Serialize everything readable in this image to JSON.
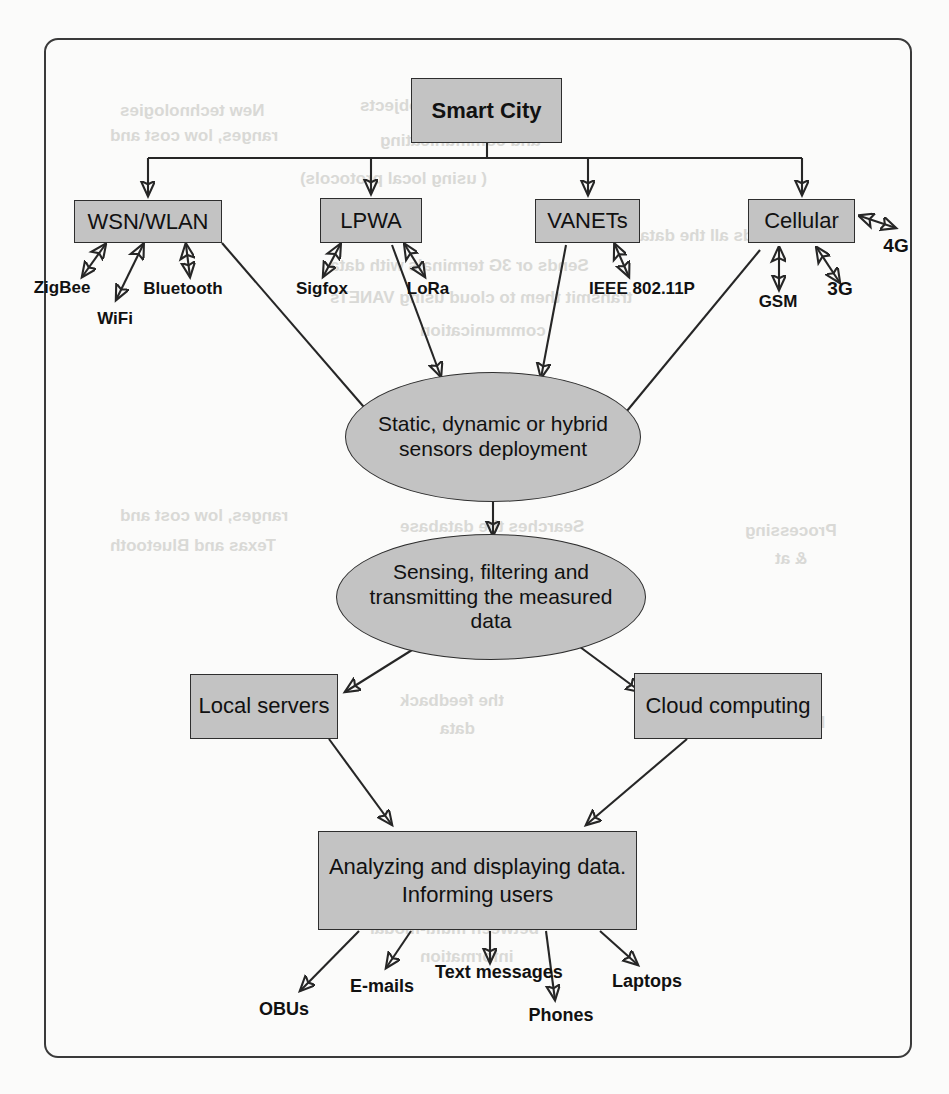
{
  "figure": {
    "type": "flowchart",
    "page_top_caption": "",
    "frame_style": "rounded-rectangle",
    "colors": {
      "node_fill": "#c3c3c3",
      "node_stroke": "#2e2e2e",
      "edge": "#262626",
      "page": "#fbfbfa",
      "text": "#111111"
    }
  },
  "nodes": {
    "root": {
      "label": "Smart City"
    },
    "networks": [
      {
        "id": "wsn_wlan",
        "label": "WSN/WLAN"
      },
      {
        "id": "lpwa",
        "label": "LPWA"
      },
      {
        "id": "vanets",
        "label": "VANETs"
      },
      {
        "id": "cellular",
        "label": "Cellular"
      }
    ],
    "technologies": {
      "wsn_wlan": [
        "ZigBee",
        "WiFi",
        "Bluetooth"
      ],
      "lpwa": [
        "Sigfox",
        "LoRa"
      ],
      "vanets": [
        "IEEE 802.11P"
      ],
      "cellular": [
        "GSM",
        "3G",
        "4G"
      ]
    },
    "process": [
      {
        "id": "deployment",
        "label": "Static, dynamic or hybrid sensors deployment",
        "shape": "ellipse"
      },
      {
        "id": "sensing",
        "label": "Sensing, filtering and transmitting the measured data",
        "shape": "ellipse"
      }
    ],
    "storage": [
      {
        "id": "local_servers",
        "label": "Local servers"
      },
      {
        "id": "cloud_computing",
        "label": "Cloud computing"
      }
    ],
    "analysis": {
      "id": "analyzing",
      "label": "Analyzing and displaying data. Informing users"
    },
    "outputs": [
      "OBUs",
      "E-mails",
      "Text messages",
      "Phones",
      "Laptops"
    ]
  },
  "edges": [
    {
      "from": "root",
      "to": "wsn_wlan",
      "arrow": "single"
    },
    {
      "from": "root",
      "to": "lpwa",
      "arrow": "single"
    },
    {
      "from": "root",
      "to": "vanets",
      "arrow": "single"
    },
    {
      "from": "root",
      "to": "cellular",
      "arrow": "single"
    },
    {
      "from": "wsn_wlan",
      "to": "ZigBee",
      "arrow": "double"
    },
    {
      "from": "wsn_wlan",
      "to": "WiFi",
      "arrow": "double"
    },
    {
      "from": "wsn_wlan",
      "to": "Bluetooth",
      "arrow": "double"
    },
    {
      "from": "lpwa",
      "to": "Sigfox",
      "arrow": "double"
    },
    {
      "from": "lpwa",
      "to": "LoRa",
      "arrow": "double"
    },
    {
      "from": "vanets",
      "to": "IEEE 802.11P",
      "arrow": "double"
    },
    {
      "from": "cellular",
      "to": "GSM",
      "arrow": "double"
    },
    {
      "from": "cellular",
      "to": "3G",
      "arrow": "double"
    },
    {
      "from": "cellular",
      "to": "4G",
      "arrow": "double"
    },
    {
      "from": "wsn_wlan",
      "to": "deployment",
      "arrow": "single"
    },
    {
      "from": "lpwa",
      "to": "deployment",
      "arrow": "single"
    },
    {
      "from": "vanets",
      "to": "deployment",
      "arrow": "single"
    },
    {
      "from": "cellular",
      "to": "deployment",
      "arrow": "single"
    },
    {
      "from": "deployment",
      "to": "sensing",
      "arrow": "single"
    },
    {
      "from": "sensing",
      "to": "local_servers",
      "arrow": "single"
    },
    {
      "from": "sensing",
      "to": "cloud_computing",
      "arrow": "single"
    },
    {
      "from": "local_servers",
      "to": "analyzing",
      "arrow": "single"
    },
    {
      "from": "cloud_computing",
      "to": "analyzing",
      "arrow": "single"
    },
    {
      "from": "analyzing",
      "to": "OBUs",
      "arrow": "single"
    },
    {
      "from": "analyzing",
      "to": "E-mails",
      "arrow": "single"
    },
    {
      "from": "analyzing",
      "to": "Text messages",
      "arrow": "single"
    },
    {
      "from": "analyzing",
      "to": "Phones",
      "arrow": "single"
    },
    {
      "from": "analyzing",
      "to": "Laptops",
      "arrow": "single"
    }
  ],
  "bleed_through": {
    "l1": "Smart City objects",
    "l2": "and communicating",
    "l3": "( using local protocols)",
    "l4": "Sends all the data",
    "l5": "Sends or 3G terminals with data",
    "l6": "transmit them to cloud using VANETs",
    "l7": "communication",
    "l8": "Searches the database",
    "l9": "and uses",
    "l10": "Processing",
    "l11": "& at",
    "l12": "New technologies",
    "l13": "ranges, low cost and",
    "l14": "Texas and Bluetooth",
    "l15": "the feedback",
    "l16": "data",
    "l17": "No, new",
    "l18": "Exchange",
    "l19": "between multi-modal",
    "l20": "information"
  }
}
